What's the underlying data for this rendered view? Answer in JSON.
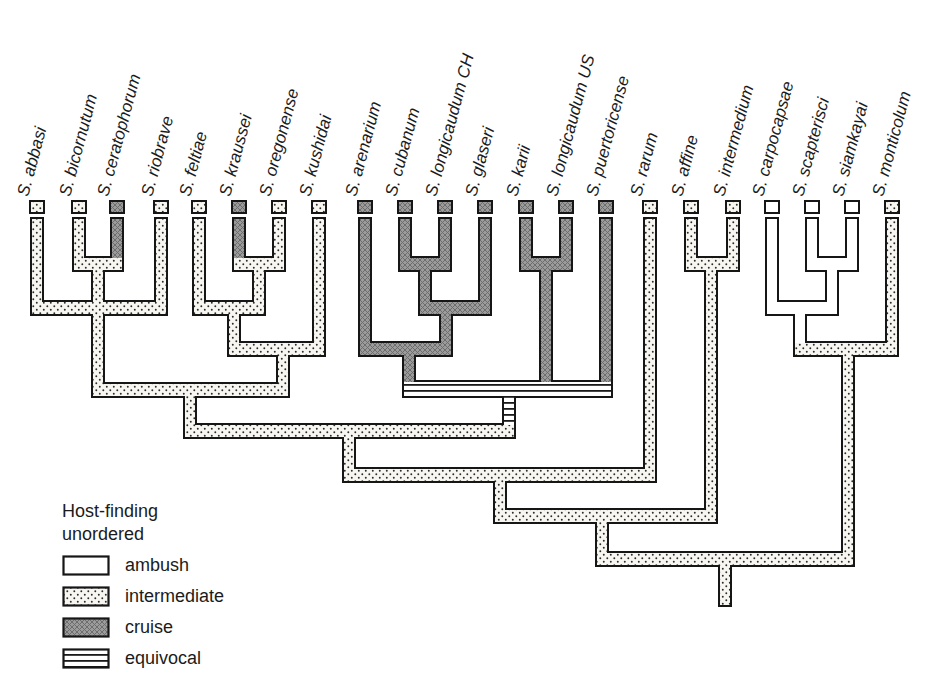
{
  "figure": {
    "type": "cladogram",
    "topology_newick": "((((((S. abbasi,(S. bicornutum,S. ceratophorum),S. riobrave),((S. feltiae,(S. kraussei,S. oregonense)),S. kushidai)),((S. arenarium,((S. cubanum,S. longicaudum CH),S. glaseri)),(S. karii,S. longicaudum US),S. puertoricense)),S. rarum),(S. affine,S. intermedium)),((S. carpocapsae,(S. scapterisci,S. siamkayai)),S. monticolum))"
  },
  "colors": {
    "outline": "#161616",
    "text": "#1b1b1b",
    "ambush_fill": "#ffffff",
    "stipple_bg": "#f7f6f1",
    "stipple_dot": "#2c2c2c",
    "cruise_bg": "#9b9b9b",
    "cruise_line": "#6d6d6d",
    "equivocal_bg": "#ffffff",
    "equivocal_stripe": "#1a1a1a"
  },
  "legend": {
    "title_lines": [
      "Host-finding",
      "unordered"
    ],
    "items": [
      {
        "label": "ambush",
        "pattern": "ambush"
      },
      {
        "label": "intermediate",
        "pattern": "intermediate"
      },
      {
        "label": "cruise",
        "pattern": "cruise"
      },
      {
        "label": "equivocal",
        "pattern": "equivocal"
      }
    ]
  },
  "tree": {
    "pipe_w": 14,
    "bar_h": 16,
    "tip_top": 217,
    "box": {
      "y": 200,
      "w": 16,
      "h": 14
    },
    "tips": [
      {
        "name": "S. abbasi",
        "x": 37,
        "y2": 316,
        "cat": "intermediate"
      },
      {
        "name": "S. bicornutum",
        "x": 79,
        "y2": 272,
        "cat": "intermediate"
      },
      {
        "name": "S. ceratophorum",
        "x": 117,
        "y2": 272,
        "cat": "cruise"
      },
      {
        "name": "S. riobrave",
        "x": 161,
        "y2": 316,
        "cat": "intermediate"
      },
      {
        "name": "S. feltiae",
        "x": 199,
        "y2": 316,
        "cat": "intermediate"
      },
      {
        "name": "S. kraussei",
        "x": 239,
        "y2": 272,
        "cat": "cruise"
      },
      {
        "name": "S. oregonense",
        "x": 279,
        "y2": 272,
        "cat": "intermediate"
      },
      {
        "name": "S. kushidai",
        "x": 319,
        "y2": 357,
        "cat": "intermediate"
      },
      {
        "name": "S. arenarium",
        "x": 365,
        "y2": 357,
        "cat": "cruise"
      },
      {
        "name": "S. cubanum",
        "x": 405,
        "y2": 272,
        "cat": "cruise"
      },
      {
        "name": "S. longicaudum CH",
        "x": 445,
        "y2": 272,
        "cat": "cruise"
      },
      {
        "name": "S. glaseri",
        "x": 485,
        "y2": 316,
        "cat": "cruise"
      },
      {
        "name": "S. karii",
        "x": 526,
        "y2": 272,
        "cat": "cruise"
      },
      {
        "name": "S. longicaudum US",
        "x": 566,
        "y2": 272,
        "cat": "cruise"
      },
      {
        "name": "S. puertoricense",
        "x": 606,
        "y2": 398,
        "cat": "cruise"
      },
      {
        "name": "S. rarum",
        "x": 650,
        "y2": 483,
        "cat": "intermediate"
      },
      {
        "name": "S. affine",
        "x": 691,
        "y2": 272,
        "cat": "intermediate"
      },
      {
        "name": "S. intermedium",
        "x": 733,
        "y2": 272,
        "cat": "intermediate"
      },
      {
        "name": "S. carpocapsae",
        "x": 772,
        "y2": 316,
        "cat": "ambush"
      },
      {
        "name": "S. scapterisci",
        "x": 812,
        "y2": 272,
        "cat": "ambush"
      },
      {
        "name": "S. siamkayai",
        "x": 852,
        "y2": 272,
        "cat": "ambush"
      },
      {
        "name": "S. monticolum",
        "x": 892,
        "y2": 357,
        "cat": "intermediate"
      }
    ],
    "stems": [
      {
        "x": 98,
        "y1": 256,
        "y2": 398,
        "cat": "intermediate"
      },
      {
        "x": 259,
        "y1": 256,
        "y2": 316,
        "cat": "intermediate"
      },
      {
        "x": 234,
        "y1": 300,
        "y2": 357,
        "cat": "intermediate"
      },
      {
        "x": 283,
        "y1": 341,
        "y2": 398,
        "cat": "intermediate"
      },
      {
        "x": 190,
        "y1": 382,
        "y2": 439,
        "cat": "intermediate"
      },
      {
        "x": 425,
        "y1": 256,
        "y2": 316,
        "cat": "cruise"
      },
      {
        "x": 446,
        "y1": 300,
        "y2": 357,
        "cat": "cruise"
      },
      {
        "x": 409,
        "y1": 341,
        "y2": 398,
        "cat": "cruise"
      },
      {
        "x": 546,
        "y1": 256,
        "y2": 398,
        "cat": "cruise"
      },
      {
        "x": 509,
        "y1": 380,
        "y2": 439,
        "cat": "equivocal"
      },
      {
        "x": 349,
        "y1": 423,
        "y2": 483,
        "cat": "intermediate"
      },
      {
        "x": 500,
        "y1": 467,
        "y2": 524,
        "cat": "intermediate"
      },
      {
        "x": 602,
        "y1": 508,
        "y2": 567,
        "cat": "intermediate"
      },
      {
        "x": 711,
        "y1": 256,
        "y2": 524,
        "cat": "intermediate"
      },
      {
        "x": 832,
        "y1": 256,
        "y2": 316,
        "cat": "ambush"
      },
      {
        "x": 800,
        "y1": 300,
        "y2": 357,
        "cat": "ambush"
      },
      {
        "x": 848,
        "y1": 341,
        "y2": 567,
        "cat": "intermediate"
      },
      {
        "x": 725,
        "y1": 551,
        "y2": 607,
        "cat": "intermediate"
      }
    ],
    "bars": [
      {
        "y": 256,
        "x1": 72,
        "x2": 124,
        "cat": "intermediate"
      },
      {
        "y": 256,
        "x1": 232,
        "x2": 286,
        "cat": "intermediate"
      },
      {
        "y": 256,
        "x1": 398,
        "x2": 452,
        "cat": "cruise"
      },
      {
        "y": 256,
        "x1": 519,
        "x2": 573,
        "cat": "cruise"
      },
      {
        "y": 256,
        "x1": 684,
        "x2": 740,
        "cat": "intermediate"
      },
      {
        "y": 256,
        "x1": 805,
        "x2": 859,
        "cat": "ambush"
      },
      {
        "y": 300,
        "x1": 30,
        "x2": 168,
        "cat": "intermediate"
      },
      {
        "y": 300,
        "x1": 192,
        "x2": 266,
        "cat": "intermediate"
      },
      {
        "y": 300,
        "x1": 418,
        "x2": 492,
        "cat": "cruise"
      },
      {
        "y": 300,
        "x1": 765,
        "x2": 839,
        "cat": "ambush"
      },
      {
        "y": 341,
        "x1": 227,
        "x2": 326,
        "cat": "intermediate"
      },
      {
        "y": 341,
        "x1": 358,
        "x2": 453,
        "cat": "cruise"
      },
      {
        "y": 341,
        "x1": 793,
        "x2": 899,
        "cat": "intermediate"
      },
      {
        "y": 382,
        "x1": 91,
        "x2": 290,
        "cat": "intermediate"
      },
      {
        "y": 380,
        "x1": 402,
        "x2": 613,
        "cat": "equivocal",
        "h": 18
      },
      {
        "y": 423,
        "x1": 183,
        "x2": 516,
        "cat": "intermediate"
      },
      {
        "y": 467,
        "x1": 342,
        "x2": 657,
        "cat": "intermediate"
      },
      {
        "y": 508,
        "x1": 493,
        "x2": 718,
        "cat": "intermediate"
      },
      {
        "y": 551,
        "x1": 595,
        "x2": 855,
        "cat": "intermediate"
      }
    ]
  }
}
